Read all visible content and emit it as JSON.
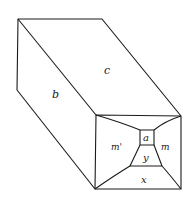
{
  "figure": {
    "colors": {
      "line": "#1a1a1a",
      "background": "#ffffff"
    },
    "faces": [
      {
        "id": "c",
        "label": "c",
        "x": 104,
        "y": 74
      },
      {
        "id": "b",
        "label": "b",
        "x": 54,
        "y": 98
      },
      {
        "id": "m_prime",
        "label": "m'",
        "x": 113,
        "y": 149
      },
      {
        "id": "a",
        "label": "a",
        "x": 144,
        "y": 141
      },
      {
        "id": "m",
        "label": "m",
        "x": 163,
        "y": 149
      },
      {
        "id": "y",
        "label": "y",
        "x": 144,
        "y": 160
      },
      {
        "id": "x",
        "label": "x",
        "x": 143,
        "y": 182
      }
    ]
  }
}
